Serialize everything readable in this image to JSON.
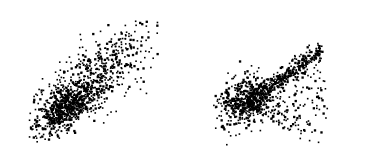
{
  "figure": {
    "type": "scatter-pair",
    "width": 372,
    "height": 166,
    "background_color": "#ffffff",
    "frame_color": "#2b2b2b",
    "frame_width_px": 1.2,
    "point_color": "#000000",
    "title": "",
    "caption": ""
  },
  "chart_data": [
    {
      "id": "left-panel",
      "type": "scatter",
      "title": "",
      "xlabel": "",
      "ylabel": "",
      "xlim": [
        0,
        1
      ],
      "ylim": [
        0,
        1
      ],
      "grid": false,
      "legend": null,
      "tick_labels_x": [],
      "tick_labels_y": [],
      "axis_ticks_visible": false,
      "frame_visible": true,
      "marker": "square",
      "marker_size_px": 1.6,
      "marker_color": "#000000",
      "n_points": 1150,
      "description": "Elongated positively-correlated elliptical point cloud tilted about 35 degrees, with a very dense near-solid black core in the lower-left quadrant thinning gradually into sparse scattered points toward the upper-right corner.",
      "distribution": {
        "model": "bivariate-normal-mixture",
        "components": [
          {
            "name": "dense-core",
            "weight": 0.42,
            "mean_x": 0.3,
            "mean_y": 0.3,
            "sd_x": 0.095,
            "sd_y": 0.085,
            "correlation": 0.55,
            "jitter": 0.012
          },
          {
            "name": "mid-body",
            "weight": 0.36,
            "mean_x": 0.42,
            "mean_y": 0.44,
            "sd_x": 0.165,
            "sd_y": 0.15,
            "correlation": 0.66,
            "jitter": 0.01
          },
          {
            "name": "sparse-tail",
            "weight": 0.22,
            "mean_x": 0.62,
            "mean_y": 0.66,
            "sd_x": 0.2,
            "sd_y": 0.18,
            "correlation": 0.62,
            "jitter": 0.01
          }
        ],
        "clip_box": [
          0.03,
          0.03,
          0.97,
          0.97
        ],
        "seed": 20451
      }
    },
    {
      "id": "right-panel",
      "type": "scatter",
      "title": "",
      "xlabel": "",
      "ylabel": "",
      "xlim": [
        0,
        1
      ],
      "ylim": [
        0,
        1
      ],
      "grid": false,
      "legend": null,
      "tick_labels_x": [],
      "tick_labels_y": [],
      "axis_ticks_visible": false,
      "frame_visible": true,
      "marker": "square",
      "marker_size_px": 1.6,
      "marker_color": "#000000",
      "n_points": 1050,
      "description": "Wedge or fan shaped point cloud with a dense black core at the left-centre, a sharp narrow high-density ridge running along the upper diagonal edge toward the upper-right, and sparser points fanning downward and to the right beneath the ridge.",
      "distribution": {
        "model": "wedge-fan",
        "components": [
          {
            "name": "dense-core",
            "weight": 0.38,
            "mean_x": 0.24,
            "mean_y": 0.36,
            "sd_x": 0.085,
            "sd_y": 0.105,
            "correlation": 0.3,
            "jitter": 0.012
          },
          {
            "name": "upper-ridge",
            "weight": 0.3,
            "ridge": true,
            "x_start": 0.22,
            "x_end": 0.8,
            "slope": 0.78,
            "intercept": 0.3,
            "band_sd": 0.035,
            "jitter": 0.01
          },
          {
            "name": "lower-fan",
            "weight": 0.32,
            "fan": true,
            "apex_x": 0.22,
            "apex_y": 0.36,
            "angle_min_deg": -28,
            "angle_max_deg": 36,
            "radius_min": 0.05,
            "radius_max": 0.62,
            "radial_power": 1.35,
            "jitter": 0.01
          }
        ],
        "clip_box": [
          0.03,
          0.03,
          0.97,
          0.97
        ],
        "seed": 77310
      }
    }
  ]
}
